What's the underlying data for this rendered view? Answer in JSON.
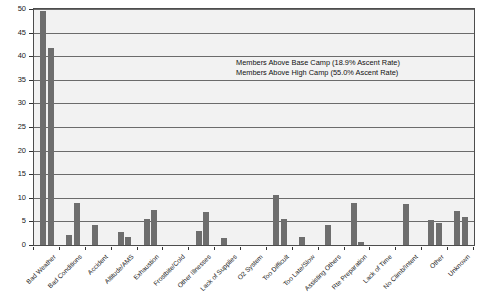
{
  "chart_data": {
    "type": "bar",
    "title": "",
    "subtitle": "",
    "xlabel": "",
    "ylabel": "",
    "ylim": [
      0,
      50
    ],
    "ytick_step": 5,
    "grid": true,
    "grid_axis": "y",
    "legend_position": "inside-upper-right",
    "bar_color": "#6e6e6e",
    "plot_background": "#f2f2f2",
    "frame_color": "#4d4d4d",
    "yticks": [
      "0",
      "5",
      "10",
      "15",
      "20",
      "25",
      "30",
      "35",
      "40",
      "45",
      "50"
    ],
    "categories": [
      "Bad Weather",
      "Bad Conditions",
      "Accident",
      "Altitude/AMS",
      "Exhaustion",
      "Frostbite/Cold",
      "Other Illnesses",
      "Lack of Supplies",
      "O2 System",
      "Too Difficult",
      "Too Late/Slow",
      "Assisting Others",
      "Rte Preparation",
      "Lack of Time",
      "No Climb/Intent",
      "Other",
      "Unknown"
    ],
    "series": [
      {
        "name": "Members Above Base Camp (18.9% Ascent Rate)",
        "values": [
          49.5,
          2.1,
          4.3,
          2.8,
          5.6,
          0.0,
          3.0,
          1.5,
          0.0,
          10.6,
          1.7,
          4.3,
          9.0,
          0.0,
          8.7,
          5.3,
          7.3
        ]
      },
      {
        "name": "Members Above High Camp (55.0% Ascent Rate)",
        "values": [
          41.7,
          9.0,
          0.0,
          1.6,
          7.4,
          0.0,
          7.1,
          0.0,
          0.0,
          5.6,
          0.0,
          0.0,
          0.6,
          0.0,
          0.0,
          4.7,
          6.0
        ]
      }
    ],
    "legend": [
      "Members Above Base Camp (18.9% Ascent Rate)",
      "Members Above High Camp (55.0% Ascent Rate)"
    ]
  }
}
